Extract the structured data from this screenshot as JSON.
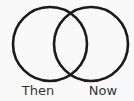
{
  "diagram": {
    "type": "venn",
    "sets": [
      {
        "label": "Then",
        "cx": 50,
        "cy": 44,
        "r": 37
      },
      {
        "label": "Now",
        "cx": 91,
        "cy": 44,
        "r": 37
      }
    ],
    "stroke_color": "#1a1a1a",
    "stroke_width": 2.6,
    "label_color": "#333333",
    "background": "#f9f9f9"
  }
}
